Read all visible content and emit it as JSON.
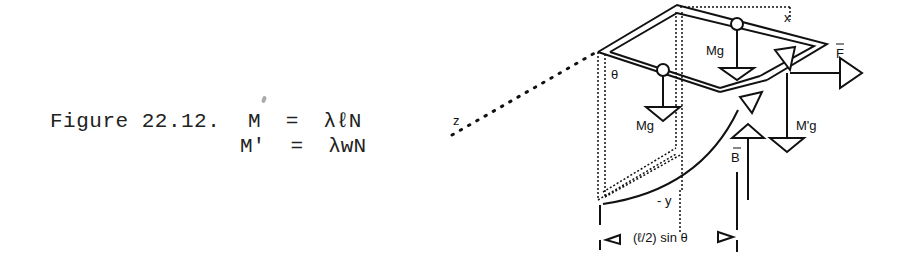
{
  "caption": {
    "label": "Figure 22.12.",
    "equations": [
      {
        "lhs": "M",
        "rhs": "λℓN",
        "text": "M  =  λℓN"
      },
      {
        "lhs": "M'",
        "rhs": "λwN",
        "text": "M'  =  λwN"
      }
    ]
  },
  "diagram": {
    "axis_labels": {
      "x": "x",
      "y": "- y",
      "z": "z"
    },
    "angle_label": "θ",
    "forces": {
      "mg_top": "Mg",
      "mg_left": "Mg",
      "mprime_g": "M'g",
      "F": "F",
      "B": "B"
    },
    "dimension_label": "(ℓ/2) sin θ"
  }
}
